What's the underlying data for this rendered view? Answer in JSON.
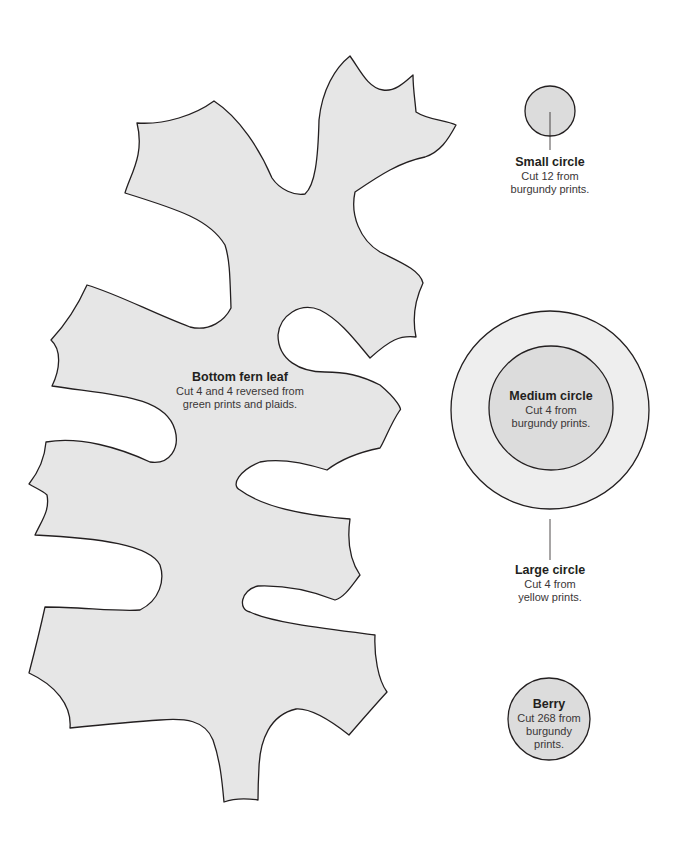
{
  "colors": {
    "shape_fill": "#e6e6e6",
    "inner_fill": "#dcdcdc",
    "outer_ring_fill": "#eeeeee",
    "stroke": "#231f20",
    "background": "#ffffff"
  },
  "pieces": {
    "fern_leaf": {
      "title": "Bottom fern leaf",
      "line1": "Cut 4 and 4 reversed from",
      "line2": "green prints and plaids."
    },
    "small_circle": {
      "title": "Small circle",
      "line1": "Cut 12 from",
      "line2": "burgundy prints."
    },
    "medium_circle": {
      "title": "Medium circle",
      "line1": "Cut 4 from",
      "line2": "burgundy prints."
    },
    "large_circle": {
      "title": "Large circle",
      "line1": "Cut 4 from",
      "line2": "yellow prints."
    },
    "berry": {
      "title": "Berry",
      "line1": "Cut 268 from",
      "line2": "burgundy",
      "line3": "prints."
    }
  }
}
